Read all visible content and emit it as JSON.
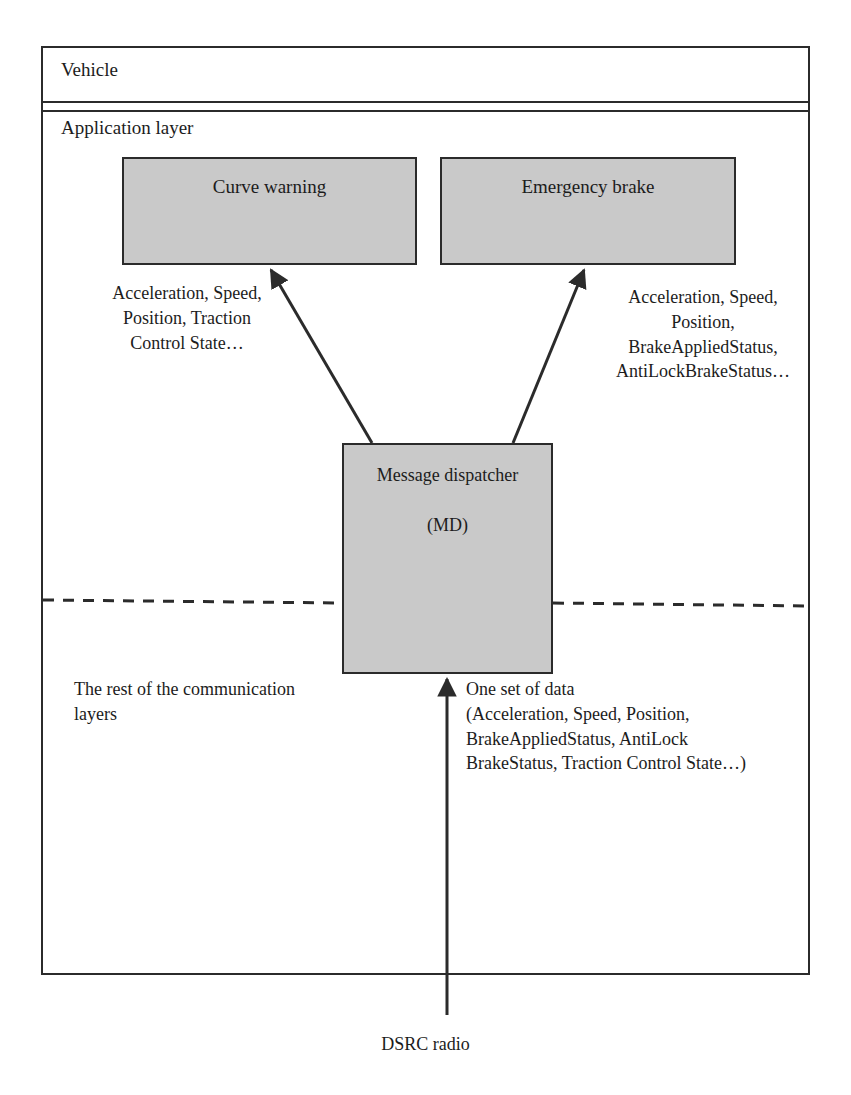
{
  "figure": {
    "container_label": "Vehicle",
    "layer_label": "Application layer",
    "background_color": "#ffffff",
    "box_fill_color": "#c9c9c9",
    "line_color": "#2b2b2b"
  },
  "app_boxes": [
    {
      "id": "curve-warning",
      "label": "Curve warning"
    },
    {
      "id": "emergency-brake",
      "label": "Emergency brake"
    }
  ],
  "dispatcher": {
    "name": "Message\ndispatcher",
    "abbreviation": "(MD)"
  },
  "annotations": {
    "left_flow": "Acceleration, Speed,\nPosition, Traction\nControl State…",
    "right_flow": "Acceleration, Speed,\nPosition,\nBrakeAppliedStatus,\nAntiLockBrakeStatus…",
    "lower_layers": "The rest of the communication\nlayers",
    "input_data": "One set of data\n(Acceleration, Speed, Position,\nBrakeAppliedStatus, AntiLock\nBrakeStatus, Traction Control State…)"
  },
  "radio": {
    "label": "DSRC radio"
  },
  "divider": {
    "style": "dashed",
    "description": "separates application layer from lower communication layers"
  },
  "arrows": [
    {
      "id": "md-to-curve-warning",
      "from": "message-dispatcher",
      "to": "curve-warning"
    },
    {
      "id": "md-to-emergency-brake",
      "from": "message-dispatcher",
      "to": "emergency-brake"
    },
    {
      "id": "radio-to-md",
      "from": "dsrc-radio",
      "to": "message-dispatcher"
    }
  ]
}
